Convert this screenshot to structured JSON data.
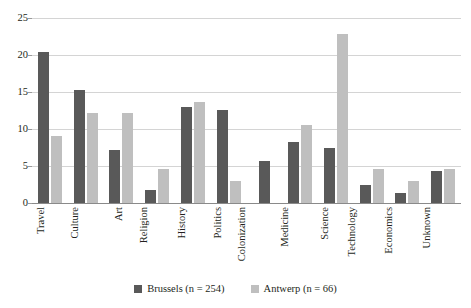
{
  "chart_data": {
    "type": "bar",
    "title": "",
    "subtitle": "",
    "xlabel": "",
    "ylabel": "",
    "ylim": [
      0,
      25
    ],
    "yticks": [
      0,
      5,
      10,
      15,
      20,
      25
    ],
    "grid": true,
    "legend_position": "bottom",
    "categories": [
      "Travel",
      "Culture",
      "Art",
      "Religion",
      "History",
      "Politics",
      "Colonization",
      "Medicine",
      "Science",
      "Technology",
      "Economics",
      "Unknown"
    ],
    "series": [
      {
        "name": "Brussels (n = 254)",
        "color": "#595959",
        "values": [
          20.4,
          15.3,
          7.2,
          1.8,
          13.0,
          12.6,
          5.7,
          8.2,
          7.5,
          2.4,
          1.3,
          4.3
        ]
      },
      {
        "name": "Antwerp (n = 66)",
        "color": "#bfbfbf",
        "values": [
          9.0,
          12.1,
          12.1,
          4.6,
          13.7,
          3.0,
          0,
          10.6,
          22.8,
          4.6,
          3.0,
          4.6
        ]
      }
    ]
  },
  "axis": {
    "y_tick_labels": [
      "0",
      "5",
      "10",
      "15",
      "20",
      "25"
    ]
  },
  "legend": {
    "items": [
      {
        "label": "Brussels (n = 254)",
        "color": "#595959"
      },
      {
        "label": "Antwerp (n = 66)",
        "color": "#bfbfbf"
      }
    ]
  },
  "colors": {
    "brussels": "#595959",
    "antwerp": "#bfbfbf",
    "gridline": "#d4d4d4",
    "axis": "#8a8a8a",
    "text": "#231f20"
  }
}
